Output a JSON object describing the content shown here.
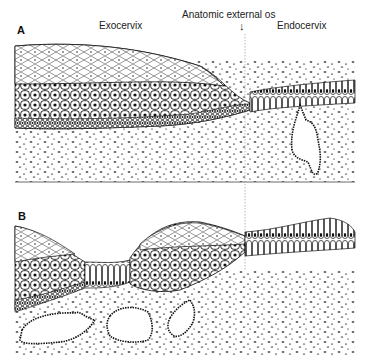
{
  "labels": {
    "exocervix": "Exocervix",
    "os": "Anatomic external os",
    "arrow": "↓",
    "endocervix": "Endocervix"
  },
  "panels": [
    {
      "id": "A",
      "letter": "A"
    },
    {
      "id": "B",
      "letter": "B"
    }
  ],
  "colors": {
    "ink": "#111111",
    "background": "#ffffff"
  }
}
